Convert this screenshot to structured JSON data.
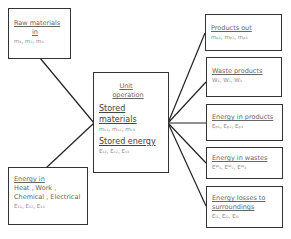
{
  "boxes": {
    "raw": {
      "title": "Raw materials",
      "line2": "in",
      "vars": "m₁, m₂, m₃"
    },
    "energy_in": {
      "title": "Energy in",
      "line2": "Heat , Work ,",
      "line3": "Chemical , Electrical",
      "vars": "E₁₁, E₁₂, E₁₃"
    },
    "center": {
      "title1": "Unit",
      "title2": "operation",
      "stored_materials": "Stored materials",
      "sm_vars": "mₛ₁, mₛ₂, mₛ₃",
      "stored_energy": "Stored energy",
      "se_vars": "Eₛ₁, Eₛ₂, Eₛ₃"
    },
    "products": {
      "title": "Products out",
      "vars": "mₚ₁, mₚ₂, mₚ₃"
    },
    "waste": {
      "title": "Waste products",
      "vars": "W₁, W₂, W₃"
    },
    "energy_products": {
      "title": "Energy in products",
      "vars": "Eₚ₁, Eₚ₂, Eₚ₃"
    },
    "energy_wastes": {
      "title": "Energy in wastes",
      "vars": "Eᵂ₁, Eᵂ₂, Eᵂ₃"
    },
    "energy_losses": {
      "title": "Energy losses to",
      "line2": "surroundings",
      "vars": "Eₗ₁, Eₗ₂, Eₗ₃"
    }
  }
}
